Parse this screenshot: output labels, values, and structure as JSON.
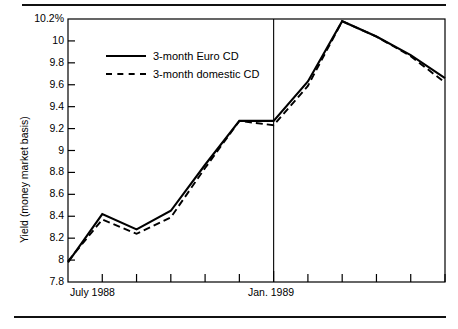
{
  "chart_data": {
    "type": "line",
    "title": "",
    "xlabel": "",
    "ylabel": "Yield (money market basis)",
    "ylim": [
      7.8,
      10.2
    ],
    "yticks": [
      "7.8",
      "8",
      "8.2",
      "8.4",
      "8.6",
      "8.8",
      "9",
      "9.2",
      "9.4",
      "9.6",
      "9.8",
      "10",
      "10.2%"
    ],
    "grid": false,
    "legend_position": "upper-left-inside",
    "x": [
      0,
      1,
      2,
      3,
      4,
      5,
      6,
      7,
      8,
      9,
      10,
      11
    ],
    "xtick_labels": [
      "July 1988",
      "",
      "",
      "",
      "",
      "",
      "Jan. 1989",
      "",
      "",
      "",
      "",
      ""
    ],
    "annotations": [
      {
        "name": "period-divider",
        "x": 6,
        "label": "Jan. 1989"
      }
    ],
    "series": [
      {
        "name": "3-month Euro CD",
        "style": "solid",
        "values": [
          7.98,
          8.42,
          8.28,
          8.45,
          8.87,
          9.27,
          9.27,
          9.63,
          10.18,
          10.04,
          9.87,
          9.66
        ]
      },
      {
        "name": "3-month domestic CD",
        "style": "dashed",
        "values": [
          7.99,
          8.37,
          8.24,
          8.39,
          8.84,
          9.27,
          9.23,
          9.59,
          10.18,
          10.04,
          9.86,
          9.62
        ]
      }
    ]
  },
  "axes": {
    "y_title": "Yield (money market basis)",
    "y_tick_labels": [
      "10.2%",
      "10",
      "9.8",
      "9.6",
      "9.4",
      "9.2",
      "9",
      "8.8",
      "8.6",
      "8.4",
      "8.2",
      "8",
      "7.8"
    ],
    "x_tick_labels": [
      {
        "label": "July 1988",
        "index": 0
      },
      {
        "label": "Jan. 1989",
        "index": 6
      }
    ]
  },
  "legend": {
    "items": [
      {
        "label": "3-month Euro CD",
        "style": "solid"
      },
      {
        "label": "3-month domestic CD",
        "style": "dashed"
      }
    ]
  }
}
